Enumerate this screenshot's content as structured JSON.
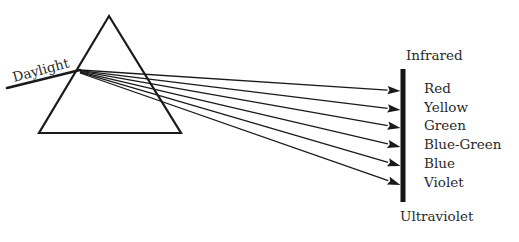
{
  "diagram": {
    "title_implied": "Dispersion of daylight by a prism",
    "colors": {
      "ink": "#1a1a1a",
      "text": "#2a2a2a",
      "background": "#ffffff"
    },
    "prism": {
      "apex": [
        109,
        16
      ],
      "base_left": [
        39,
        133
      ],
      "base_right": [
        181,
        133
      ]
    },
    "incoming_ray": {
      "label": "Daylight",
      "from": [
        7,
        88
      ],
      "to": [
        80,
        70
      ]
    },
    "dispersion_origin": [
      80,
      70
    ],
    "screen": {
      "x": 403,
      "y_top": 69,
      "y_bottom": 202,
      "width": 5
    },
    "top_label": "Infrared",
    "bottom_label": "Ultraviolet",
    "spectrum": [
      {
        "label": "Red",
        "arrow_y": 91
      },
      {
        "label": "Yellow",
        "arrow_y": 110
      },
      {
        "label": "Green",
        "arrow_y": 128
      },
      {
        "label": "Blue-Green",
        "arrow_y": 147
      },
      {
        "label": "Blue",
        "arrow_y": 166
      },
      {
        "label": "Violet",
        "arrow_y": 185
      }
    ]
  }
}
